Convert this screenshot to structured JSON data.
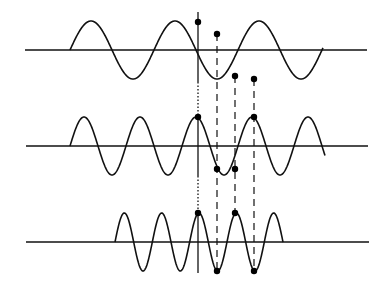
{
  "diagram": {
    "title": "",
    "colors": {
      "stroke": "#111111",
      "dot": "#000000",
      "background": "#ffffff"
    },
    "axis_x": 198,
    "waves": [
      {
        "name": "wave-low-frequency",
        "baseline_y": 50,
        "baseline_x_start": 25,
        "baseline_x_end": 367,
        "wave_x_start": 70,
        "wave_x_end": 323,
        "amplitude": 29,
        "period": 84,
        "phase_start": "zero-rising",
        "dots": [
          {
            "x": 198,
            "y": 22
          },
          {
            "x": 217,
            "y": 34
          },
          {
            "x": 235,
            "y": 76
          },
          {
            "x": 254,
            "y": 79
          }
        ]
      },
      {
        "name": "wave-mid-frequency",
        "baseline_y": 146,
        "baseline_x_start": 26,
        "baseline_x_end": 368,
        "wave_x_start": 70,
        "wave_x_end": 325,
        "amplitude": 29,
        "period": 56,
        "phase_start": "zero-rising",
        "dots": [
          {
            "x": 198,
            "y": 117
          },
          {
            "x": 217,
            "y": 169
          },
          {
            "x": 235,
            "y": 169
          },
          {
            "x": 254,
            "y": 117
          }
        ]
      },
      {
        "name": "wave-high-frequency",
        "baseline_y": 242,
        "baseline_x_start": 26,
        "baseline_x_end": 369,
        "wave_x_start": 115,
        "wave_x_end": 283,
        "amplitude": 29,
        "period": 37.33,
        "phase_start": "zero-rising",
        "dots": [
          {
            "x": 198,
            "y": 213
          },
          {
            "x": 217,
            "y": 271
          },
          {
            "x": 235,
            "y": 213
          },
          {
            "x": 254,
            "y": 271
          }
        ]
      }
    ],
    "vertical_axis_segments": [
      {
        "style": "solid",
        "y1": 12,
        "y2": 82
      },
      {
        "style": "dotted",
        "y1": 82,
        "y2": 117
      },
      {
        "style": "solid",
        "y1": 117,
        "y2": 176
      },
      {
        "style": "dotted",
        "y1": 176,
        "y2": 213
      },
      {
        "style": "solid",
        "y1": 213,
        "y2": 273
      }
    ],
    "dashed_guides": [
      {
        "x": 217,
        "y1": 34,
        "y2": 271
      },
      {
        "x": 235,
        "y1": 76,
        "y2": 213
      },
      {
        "x": 254,
        "y1": 79,
        "y2": 271
      }
    ]
  }
}
